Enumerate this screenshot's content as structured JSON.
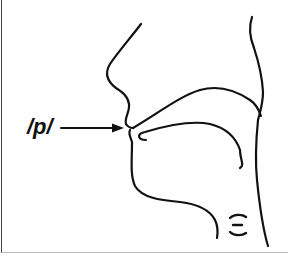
{
  "diagram": {
    "phoneme_label": "/p/",
    "arrow_target": "closed lips",
    "glottis_symbol": "voiceless glottis (open vocal folds)",
    "stroke_color": "#111111",
    "background_color": "#ffffff"
  }
}
